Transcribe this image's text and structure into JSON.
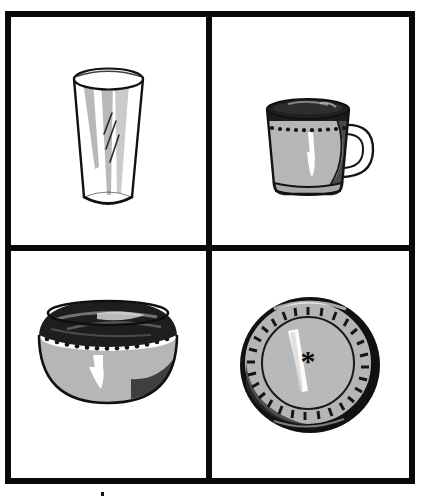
{
  "figure": {
    "layout": "2x2 grid of framed line-art panels",
    "panel_count": 4,
    "border_color": "#0a0a0a",
    "background_color": "#ffffff",
    "ink_color": "#111111",
    "fill_gray": "#b4b4b4",
    "fill_dark": "#3a3a3a",
    "highlight_color": "#ffffff"
  },
  "panels": [
    {
      "id": "glass",
      "position": "top-left",
      "object_name": "drinking glass",
      "icon": "drinking-glass-icon",
      "description": "Tall tapered tumbler seen in three-quarter view with elliptical rim, gray vertical shading stripes and two short diagonal glint strokes.",
      "features": [
        "elliptical rim",
        "tapered body",
        "elliptical base",
        "gray shading stripes",
        "diagonal glints"
      ]
    },
    {
      "id": "mug",
      "position": "top-right",
      "object_name": "mug",
      "icon": "mug-icon",
      "description": "Ceramic mug with dark interior rim, beaded dot band, gray body with white highlight, looped handle on the right and a dark shadow patch.",
      "features": [
        "dark interior rim",
        "dotted band",
        "loop handle",
        "white highlight",
        "footed base"
      ]
    },
    {
      "id": "bowl",
      "position": "bottom-left",
      "object_name": "bowl",
      "icon": "bowl-icon",
      "description": "Shallow hemispherical bowl viewed slightly from above showing dark interior, a white band with a row of dots, and gray body with dark shading at both lower sides.",
      "features": [
        "dark interior",
        "dotted band",
        "gray body",
        "side shading"
      ]
    },
    {
      "id": "plate",
      "position": "bottom-right",
      "object_name": "plate",
      "icon": "plate-icon",
      "description": "Round plate seen from above with a black outer rim, a ring of radial dashes, a gray well marked with an asterisk and a long white highlight streak.",
      "center_mark": "*",
      "features": [
        "black outer rim",
        "radial dash ring",
        "gray well",
        "asterisk center mark",
        "highlight streak"
      ]
    }
  ]
}
